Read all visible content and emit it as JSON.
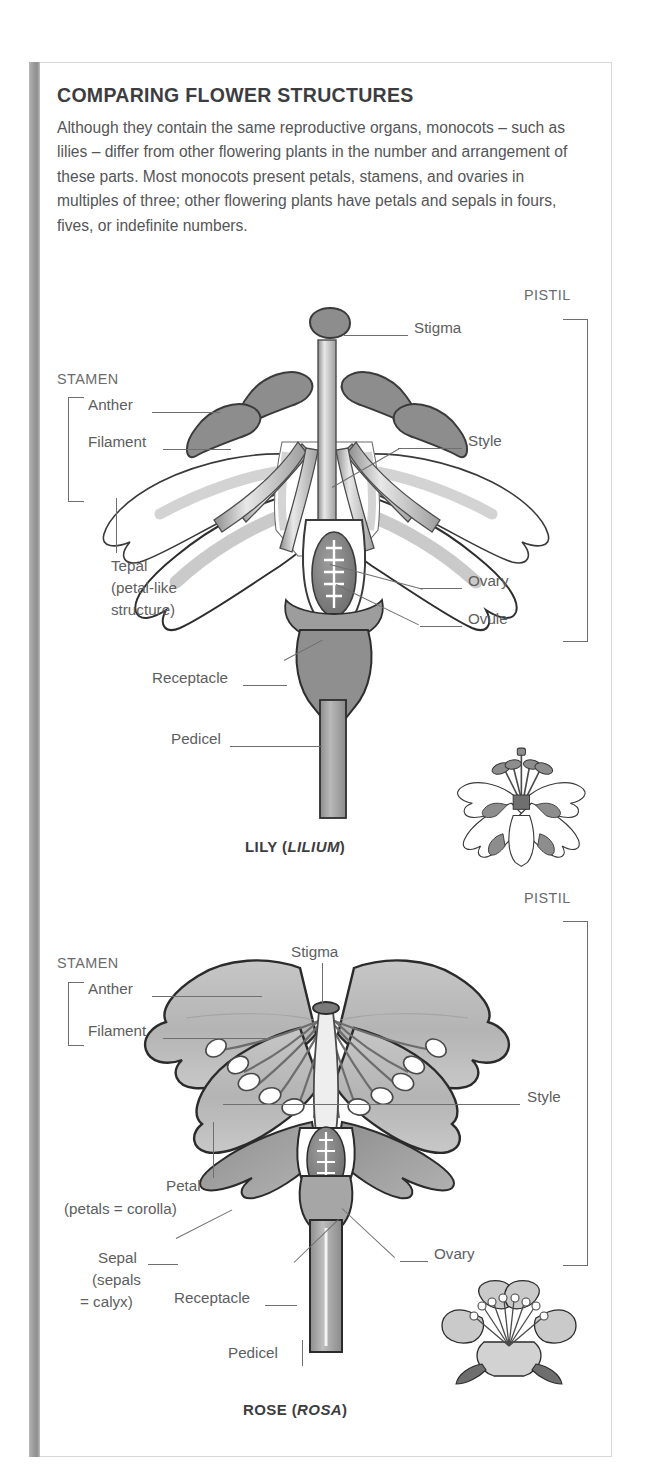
{
  "header": {
    "title": "COMPARING FLOWER STRUCTURES",
    "body": "Although they contain the same reproductive organs, monocots – such as lilies – differ from other flowering plants in the number and arrangement of these parts. Most monocots present petals, stamens, and ovaries in multiples of three; other flowering plants have petals and sepals in fours, fives, or indefinite numbers."
  },
  "lily": {
    "caption_common": "LILY (",
    "caption_genus": "LILIUM",
    "caption_close": ")",
    "groups": {
      "stamen": "STAMEN",
      "pistil": "PISTIL"
    },
    "labels": {
      "anther": "Anther",
      "filament": "Filament",
      "tepal_line1": "Tepal",
      "tepal_line2": "(petal-like",
      "tepal_line3": "structure)",
      "receptacle": "Receptacle",
      "pedicel": "Pedicel",
      "stigma": "Stigma",
      "style": "Style",
      "ovary": "Ovary",
      "ovule": "Ovule"
    }
  },
  "rose": {
    "caption_common": "ROSE (",
    "caption_genus": "ROSA",
    "caption_close": ")",
    "groups": {
      "stamen": "STAMEN",
      "pistil": "PISTIL"
    },
    "labels": {
      "anther": "Anther",
      "filament": "Filament",
      "petal_line1": "Petal",
      "petal_line2": "(petals = corolla)",
      "sepal_line1": "Sepal",
      "sepal_line2": "(sepals",
      "sepal_line3": "= calyx)",
      "receptacle": "Receptacle",
      "pedicel": "Pedicel",
      "stigma": "Stigma",
      "style": "Style",
      "ovary": "Ovary"
    }
  },
  "colors": {
    "ink": "#3d3d3f",
    "label_gray": "#5d5e60",
    "leader": "#6e6f71",
    "anther_gray": "#8a8a8a",
    "petal_gray": "#b9b9b9",
    "sepal_gray": "#9a9a9a",
    "receptacle_gray": "#a8a8a8",
    "ovule_gray": "#7d7d7d",
    "panel_border": "#d8d8d8",
    "side_bar": "#9a9a9a"
  }
}
